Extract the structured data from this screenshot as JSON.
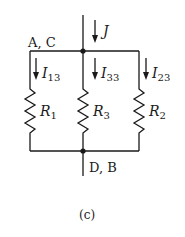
{
  "diagram": {
    "type": "circuit",
    "caption": "(c)",
    "nodes": {
      "top": "A, C",
      "bottom": "D, B"
    },
    "source_current": {
      "symbol": "J"
    },
    "branches": [
      {
        "current": "I",
        "current_sub": "13",
        "resistor": "R",
        "resistor_sub": "1"
      },
      {
        "current": "I",
        "current_sub": "33",
        "resistor": "R",
        "resistor_sub": "3"
      },
      {
        "current": "I",
        "current_sub": "23",
        "resistor": "R",
        "resistor_sub": "2"
      }
    ],
    "colors": {
      "wire": "#1a1a1a",
      "background": "#ffffff"
    }
  }
}
